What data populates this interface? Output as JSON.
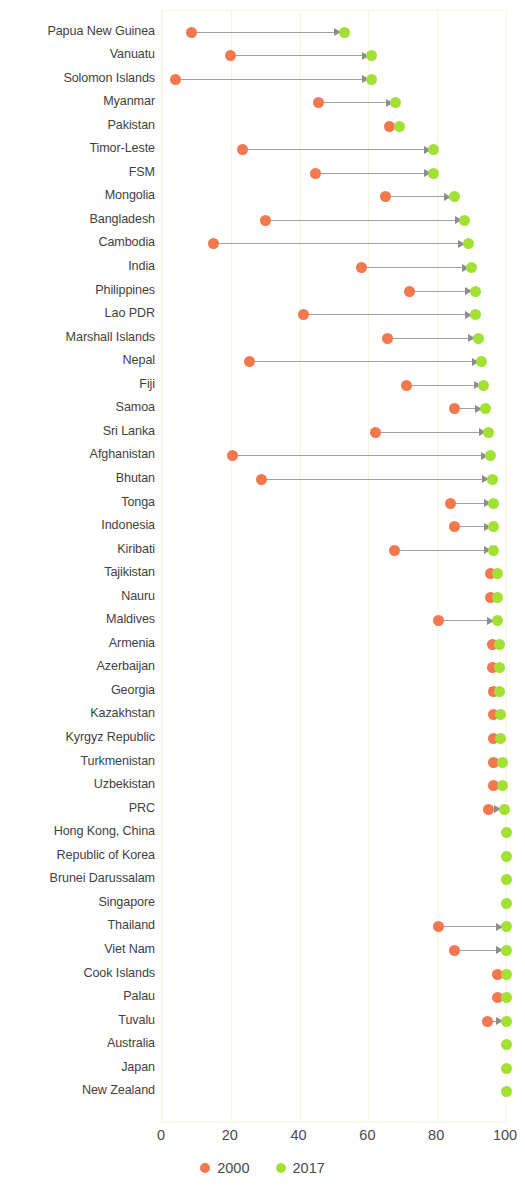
{
  "chart_data": {
    "type": "scatter",
    "subtype": "dumbbell-arrow",
    "title": "",
    "xlabel": "",
    "ylabel": "",
    "xlim": [
      0,
      104
    ],
    "xticks": [
      0,
      20,
      40,
      60,
      80,
      100
    ],
    "xtick_labels": [
      "0",
      "20",
      "40",
      "60",
      "80",
      "100"
    ],
    "grid": "vertical-only",
    "legend_position": "bottom-center",
    "series": [
      {
        "name": "2000",
        "color": "#f4784e"
      },
      {
        "name": "2017",
        "color": "#a2e033"
      }
    ],
    "categories": [
      "Papua New Guinea",
      "Vanuatu",
      "Solomon Islands",
      "Myanmar",
      "Pakistan",
      "Timor-Leste",
      "FSM",
      "Mongolia",
      "Bangladesh",
      "Cambodia",
      "India",
      "Philippines",
      "Lao PDR",
      "Marshall Islands",
      "Nepal",
      "Fiji",
      "Samoa",
      "Sri Lanka",
      "Afghanistan",
      "Bhutan",
      "Tonga",
      "Indonesia",
      "Kiribati",
      "Tajikistan",
      "Nauru",
      "Maldives",
      "Armenia",
      "Azerbaijan",
      "Georgia",
      "Kazakhstan",
      "Kyrgyz Republic",
      "Turkmenistan",
      "Uzbekistan",
      "PRC",
      "Hong Kong, China",
      "Republic of Korea",
      "Brunei Darussalam",
      "Singapore",
      "Thailand",
      "Viet Nam",
      "Cook Islands",
      "Palau",
      "Tuvalu",
      "Australia",
      "Japan",
      "New Zealand"
    ],
    "rows": [
      {
        "label": "Papua New Guinea",
        "v2000": 8.7,
        "v2017": 53.0
      },
      {
        "label": "Vanuatu",
        "v2000": 20.0,
        "v2017": 61.0
      },
      {
        "label": "Solomon Islands",
        "v2000": 4.0,
        "v2017": 61.0
      },
      {
        "label": "Myanmar",
        "v2000": 45.5,
        "v2017": 68.0
      },
      {
        "label": "Pakistan",
        "v2000": 66.0,
        "v2017": 69.0
      },
      {
        "label": "Timor-Leste",
        "v2000": 23.5,
        "v2017": 79.0
      },
      {
        "label": "FSM",
        "v2000": 44.5,
        "v2017": 79.0
      },
      {
        "label": "Mongolia",
        "v2000": 65.0,
        "v2017": 85.0
      },
      {
        "label": "Bangladesh",
        "v2000": 30.0,
        "v2017": 88.0
      },
      {
        "label": "Cambodia",
        "v2000": 15.0,
        "v2017": 89.0
      },
      {
        "label": "India",
        "v2000": 58.0,
        "v2017": 90.0
      },
      {
        "label": "Philippines",
        "v2000": 72.0,
        "v2017": 91.0
      },
      {
        "label": "Lao PDR",
        "v2000": 41.0,
        "v2017": 91.0
      },
      {
        "label": "Marshall Islands",
        "v2000": 65.5,
        "v2017": 92.0
      },
      {
        "label": "Nepal",
        "v2000": 25.5,
        "v2017": 93.0
      },
      {
        "label": "Fiji",
        "v2000": 71.0,
        "v2017": 93.5
      },
      {
        "label": "Samoa",
        "v2000": 85.0,
        "v2017": 94.0
      },
      {
        "label": "Sri Lanka",
        "v2000": 62.0,
        "v2017": 95.0
      },
      {
        "label": "Afghanistan",
        "v2000": 20.5,
        "v2017": 95.5
      },
      {
        "label": "Bhutan",
        "v2000": 29.0,
        "v2017": 96.0
      },
      {
        "label": "Tonga",
        "v2000": 84.0,
        "v2017": 96.5
      },
      {
        "label": "Indonesia",
        "v2000": 85.0,
        "v2017": 96.5
      },
      {
        "label": "Kiribati",
        "v2000": 67.5,
        "v2017": 96.5
      },
      {
        "label": "Tajikistan",
        "v2000": 95.5,
        "v2017": 97.5
      },
      {
        "label": "Nauru",
        "v2000": 95.5,
        "v2017": 97.5
      },
      {
        "label": "Maldives",
        "v2000": 80.5,
        "v2017": 97.5
      },
      {
        "label": "Armenia",
        "v2000": 96.0,
        "v2017": 98.0
      },
      {
        "label": "Azerbaijan",
        "v2000": 96.0,
        "v2017": 98.0
      },
      {
        "label": "Georgia",
        "v2000": 96.5,
        "v2017": 98.0
      },
      {
        "label": "Kazakhstan",
        "v2000": 96.5,
        "v2017": 98.5
      },
      {
        "label": "Kyrgyz Republic",
        "v2000": 96.5,
        "v2017": 98.5
      },
      {
        "label": "Turkmenistan",
        "v2000": 96.5,
        "v2017": 99.0
      },
      {
        "label": "Uzbekistan",
        "v2000": 96.5,
        "v2017": 99.0
      },
      {
        "label": "PRC",
        "v2000": 95.0,
        "v2017": 99.5
      },
      {
        "label": "Hong Kong, China",
        "v2000": 100.0,
        "v2017": 100.0
      },
      {
        "label": "Republic of Korea",
        "v2000": 100.0,
        "v2017": 100.0
      },
      {
        "label": "Brunei Darussalam",
        "v2000": 100.0,
        "v2017": 100.0
      },
      {
        "label": "Singapore",
        "v2000": 100.0,
        "v2017": 100.0
      },
      {
        "label": "Thailand",
        "v2000": 80.5,
        "v2017": 100.0
      },
      {
        "label": "Viet Nam",
        "v2000": 85.0,
        "v2017": 100.0
      },
      {
        "label": "Cook Islands",
        "v2000": 97.5,
        "v2017": 100.0
      },
      {
        "label": "Palau",
        "v2000": 97.5,
        "v2017": 100.0
      },
      {
        "label": "Tuvalu",
        "v2000": 94.5,
        "v2017": 100.0
      },
      {
        "label": "Australia",
        "v2000": 100.0,
        "v2017": 100.0
      },
      {
        "label": "Japan",
        "v2000": 100.0,
        "v2017": 100.0
      },
      {
        "label": "New Zealand",
        "v2000": 100.0,
        "v2017": 100.0
      }
    ]
  },
  "legend": {
    "items": [
      {
        "label": "2000",
        "color": "#f4784e"
      },
      {
        "label": "2017",
        "color": "#a2e033"
      }
    ]
  },
  "axis": {
    "ticks": [
      "0",
      "20",
      "40",
      "60",
      "80",
      "100"
    ]
  }
}
